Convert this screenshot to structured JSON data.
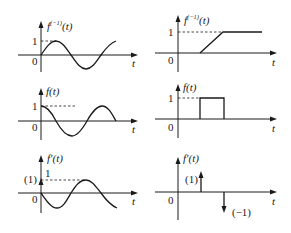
{
  "panels": [
    {
      "id": "top-left",
      "ylabel_base": "f",
      "ylabel_sup": "(−1)",
      "ylabel_arg": "(t)",
      "xlabel": "t",
      "origin": "0",
      "level_label": "1",
      "curve": "sine starting at 0, rising to 1"
    },
    {
      "id": "top-right",
      "ylabel_base": "f",
      "ylabel_sup": "(−1)",
      "ylabel_arg": "(t)",
      "xlabel": "t",
      "origin": "0",
      "level_label": "1",
      "curve": "ramp from 0 to 1 then constant"
    },
    {
      "id": "middle-left",
      "ylabel_base": "f",
      "ylabel_sup": "",
      "ylabel_arg": "(t)",
      "xlabel": "t",
      "origin": "0",
      "level_label": "1",
      "curve": "cosine starting at 1"
    },
    {
      "id": "middle-right",
      "ylabel_base": "f",
      "ylabel_sup": "",
      "ylabel_arg": "(t)",
      "xlabel": "t",
      "origin": "0",
      "level_label": "1",
      "curve": "rectangular pulse of height 1"
    },
    {
      "id": "bottom-left",
      "ylabel_base": "f′",
      "ylabel_sup": "",
      "ylabel_arg": "(t)",
      "xlabel": "t",
      "origin": "0",
      "level_label": "1",
      "impulse_label": "(1)",
      "curve": "impulse at 0 plus negative sine"
    },
    {
      "id": "bottom-right",
      "ylabel_base": "f′",
      "ylabel_sup": "",
      "ylabel_arg": "(t)",
      "xlabel": "t",
      "origin": "0",
      "impulse_pos_label": "(1)",
      "impulse_neg_label": "(−1)",
      "curve": "positive impulse then negative impulse"
    }
  ]
}
